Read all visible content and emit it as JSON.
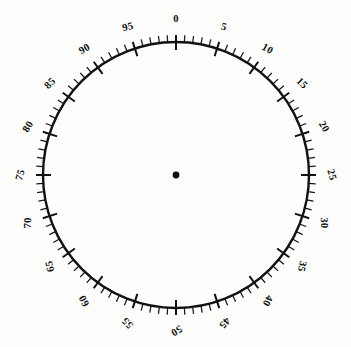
{
  "figure": {
    "kind": "circular-dial-scale",
    "title": "",
    "background_color": "#fdfdfc",
    "ink_color": "#121212"
  },
  "dial": {
    "center_x": 176,
    "center_y": 175,
    "radius": 133,
    "rim_stroke_width": 2.4,
    "center_dot_radius": 3.4,
    "direction": "clockwise",
    "zero_at": "top"
  },
  "scale": {
    "min": 0,
    "max": 100,
    "units_per_revolution": 100,
    "major_interval": 5,
    "minor_interval": 1,
    "major_tick_inner": 8,
    "major_tick_outer": 7,
    "minor_tick_inner": 0,
    "minor_tick_outer": 7,
    "label_radius_offset": 22,
    "labels_rotate_with_dial": true
  },
  "chart_data": {
    "type": "scatter",
    "xlabel": "",
    "ylabel": "",
    "categories": [
      "0",
      "5",
      "10",
      "15",
      "20",
      "25",
      "30",
      "35",
      "40",
      "45",
      "50",
      "55",
      "60",
      "65",
      "70",
      "75",
      "80",
      "85",
      "90",
      "95"
    ],
    "values": [
      0,
      5,
      10,
      15,
      20,
      25,
      30,
      35,
      40,
      45,
      50,
      55,
      60,
      65,
      70,
      75,
      80,
      85,
      90,
      95
    ],
    "major_tick_labels": [
      "0",
      "5",
      "10",
      "15",
      "20",
      "25",
      "30",
      "35",
      "40",
      "45",
      "50",
      "55",
      "60",
      "65",
      "70",
      "75",
      "80",
      "85",
      "90",
      "95"
    ],
    "major_tick_angles_deg": [
      0,
      18,
      36,
      54,
      72,
      90,
      108,
      126,
      144,
      162,
      180,
      198,
      216,
      234,
      252,
      270,
      288,
      306,
      324,
      342
    ],
    "minor_tick_count": 100,
    "legend": [],
    "grid": false,
    "annotations": [
      "center point marker"
    ]
  },
  "labels": [
    {
      "value": "0",
      "angle": 0
    },
    {
      "value": "5",
      "angle": 18
    },
    {
      "value": "10",
      "angle": 36
    },
    {
      "value": "15",
      "angle": 54
    },
    {
      "value": "20",
      "angle": 72
    },
    {
      "value": "25",
      "angle": 90
    },
    {
      "value": "30",
      "angle": 108
    },
    {
      "value": "35",
      "angle": 126
    },
    {
      "value": "40",
      "angle": 144
    },
    {
      "value": "45",
      "angle": 162
    },
    {
      "value": "50",
      "angle": 180
    },
    {
      "value": "55",
      "angle": 198
    },
    {
      "value": "60",
      "angle": 216
    },
    {
      "value": "65",
      "angle": 234
    },
    {
      "value": "70",
      "angle": 252
    },
    {
      "value": "75",
      "angle": 270
    },
    {
      "value": "80",
      "angle": 288
    },
    {
      "value": "85",
      "angle": 306
    },
    {
      "value": "90",
      "angle": 324
    },
    {
      "value": "95",
      "angle": 342
    }
  ]
}
